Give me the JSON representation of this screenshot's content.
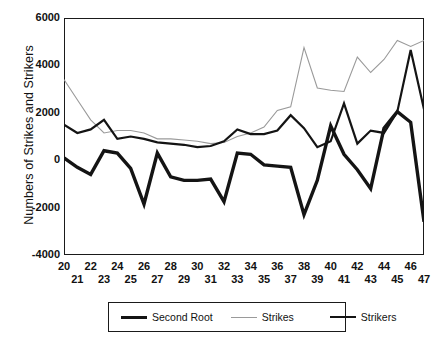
{
  "chart_data": {
    "type": "line",
    "title": "",
    "xlabel": "",
    "ylabel": "Numbers of Strikes and Strikers",
    "xlim": [
      20,
      47
    ],
    "ylim": [
      -4000,
      6000
    ],
    "grid": false,
    "legend_position": "bottom",
    "x": [
      20,
      21,
      22,
      23,
      24,
      25,
      26,
      27,
      28,
      29,
      30,
      31,
      32,
      33,
      34,
      35,
      36,
      37,
      38,
      39,
      40,
      41,
      42,
      43,
      44,
      45,
      46,
      47
    ],
    "xtick_labels_top": [
      "20",
      "22",
      "24",
      "26",
      "28",
      "30",
      "32",
      "34",
      "36",
      "38",
      "40",
      "42",
      "44",
      "46"
    ],
    "xtick_labels_bottom": [
      "21",
      "23",
      "25",
      "27",
      "29",
      "31",
      "33",
      "35",
      "37",
      "39",
      "41",
      "43",
      "45",
      "47"
    ],
    "ytick_labels": [
      "6000",
      "4000",
      "2000",
      "0",
      "-2000",
      "-4000"
    ],
    "ytick_values": [
      6000,
      4000,
      2000,
      0,
      -2000,
      -4000
    ],
    "series": [
      {
        "name": "Second Root",
        "color": "#141414",
        "width": 3.4,
        "values": [
          100,
          -300,
          -600,
          400,
          300,
          -350,
          -1850,
          300,
          -700,
          -850,
          -850,
          -800,
          -1750,
          300,
          250,
          -200,
          -250,
          -300,
          -2300,
          -850,
          1450,
          250,
          -400,
          -1200,
          1350,
          2050,
          1600,
          -2600
        ]
      },
      {
        "name": "Strikes",
        "color": "#9a9a9a",
        "width": 1.1,
        "values": [
          3400,
          2550,
          1700,
          1150,
          1250,
          1250,
          1150,
          900,
          900,
          850,
          800,
          700,
          750,
          1000,
          1150,
          1400,
          2100,
          2250,
          4750,
          3050,
          2950,
          2900,
          4350,
          3700,
          4250,
          5050,
          4800,
          5050
        ]
      },
      {
        "name": "Strikers",
        "color": "#141414",
        "width": 2.2,
        "values": [
          1500,
          1150,
          1300,
          1700,
          900,
          1000,
          900,
          750,
          700,
          650,
          550,
          600,
          800,
          1300,
          1100,
          1100,
          1250,
          1900,
          1350,
          550,
          800,
          2400,
          700,
          1250,
          1150,
          2050,
          4650,
          2150
        ]
      }
    ]
  },
  "legend": {
    "entries": [
      {
        "label": "Second Root"
      },
      {
        "label": "Strikes"
      },
      {
        "label": "Strikers"
      }
    ]
  }
}
